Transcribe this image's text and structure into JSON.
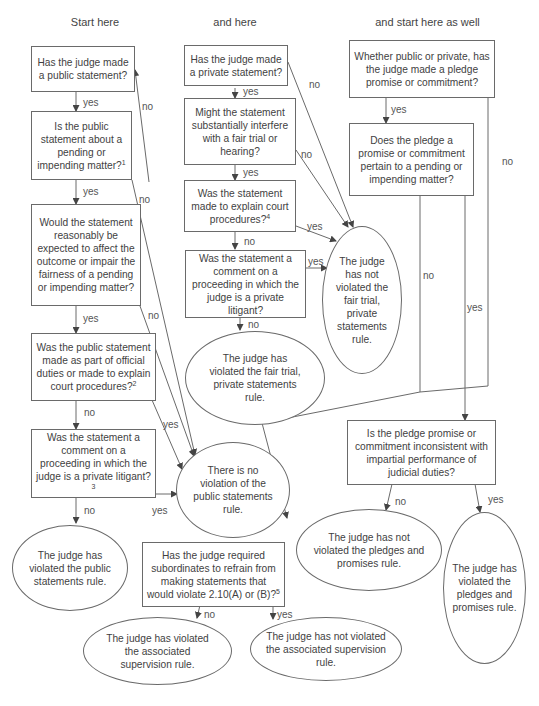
{
  "headings": {
    "col1": "Start here",
    "col2": "and here",
    "col3": "and start here as well"
  },
  "public_branch": {
    "q1": "Has the judge made a public statement?",
    "q2": "Is the public statement about a pending or impending matter?",
    "q2_fn": "1",
    "q3": "Would the statement reasonably be expected to affect the outcome or impair the fairness of a pending or impending matter?",
    "q4": "Was the public statement made as part of official duties or made to explain court procedures?",
    "q4_fn": "2",
    "q5": "Was the statement a comment on a proceeding in which the judge is a private litigant?",
    "q5_fn": "3",
    "no_violation": "There is no violation of the public statements rule.",
    "violated": "The judge has violated the public statements rule."
  },
  "private_branch": {
    "q1": "Has the judge made a private statement?",
    "q2": "Might the statement substantially interfere with a fair trial or hearing?",
    "q3": "Was the statement made to explain court procedures?",
    "q3_fn": "4",
    "q4": "Was the statement a comment on a proceeding in which the judge is a private litigant?",
    "not_violated": "The judge has not violated the fair trial, private statements rule.",
    "violated": "The judge has violated the fair trial, private statements rule."
  },
  "pledge_branch": {
    "q1": "Whether public or private, has the judge made a pledge promise or commitment?",
    "q2": "Does the pledge a promise or commitment pertain to a pending or impending matter?",
    "q3": "Is the pledge promise or commitment inconsistent with impartial performance of judicial duties?",
    "not_violated": "The judge has not violated the pledges and promises rule.",
    "violated": "The judge has violated the pledges and promises rule."
  },
  "supervision_branch": {
    "q1": "Has the judge required subordinates to refrain from making statements that would violate 2.10(A) or (B)?",
    "q1_fn": "5",
    "violated": "The judge has violated the associated supervision rule.",
    "not_violated": "The judge has not violated the associated supervision rule."
  },
  "edge_labels": {
    "yes": "yes",
    "no": "no"
  },
  "colors": {
    "line": "#6a6a6a",
    "text": "#3f3f3f",
    "background": "#ffffff"
  }
}
